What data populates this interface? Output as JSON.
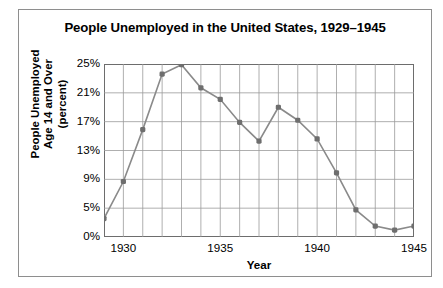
{
  "chart_data": {
    "type": "line",
    "title": "People Unemployed in the United States, 1929–1945",
    "xlabel": "Year",
    "ylabel": "People Unemployed Age 14 and Over (percent)",
    "ylabel_lines": [
      "People Unemployed",
      "Age 14 and Over",
      "(percent)"
    ],
    "x": [
      1929,
      1930,
      1931,
      1932,
      1933,
      1934,
      1935,
      1936,
      1937,
      1938,
      1939,
      1940,
      1941,
      1942,
      1943,
      1944,
      1945
    ],
    "values": [
      3.2,
      8.7,
      15.9,
      23.6,
      24.9,
      21.7,
      20.1,
      16.9,
      14.3,
      19.0,
      17.2,
      14.6,
      9.9,
      4.7,
      1.9,
      1.2,
      1.9
    ],
    "series": [
      {
        "name": "Percent unemployed",
        "values": [
          3.2,
          8.7,
          15.9,
          23.6,
          24.9,
          21.7,
          20.1,
          16.9,
          14.3,
          19.0,
          17.2,
          14.6,
          9.9,
          4.7,
          1.9,
          1.2,
          1.9
        ]
      }
    ],
    "ytick_labels": [
      "0%",
      "5%",
      "9%",
      "13%",
      "17%",
      "21%",
      "25%"
    ],
    "ytick_values": [
      0,
      5,
      9,
      13,
      17,
      21,
      25
    ],
    "xtick_labels": [
      "1930",
      "1935",
      "1940",
      "1945"
    ],
    "xtick_values": [
      1930,
      1935,
      1940,
      1945
    ],
    "xlim": [
      1929,
      1945
    ],
    "ylim": [
      0,
      25
    ],
    "grid": "both",
    "legend": "none",
    "line_color": "#8a8a8a",
    "marker_color": "#6e6e6e",
    "grid_color": "#9a9a9a",
    "axis_color": "#6d6d6d",
    "background_color": "#ffffff",
    "text_color": "#000000"
  }
}
